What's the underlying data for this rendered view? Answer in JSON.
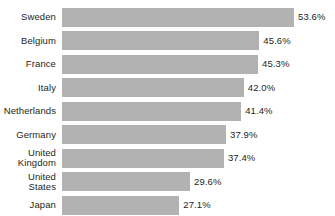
{
  "chart_data": {
    "type": "bar",
    "orientation": "horizontal",
    "title": "",
    "subtitle": "",
    "xlabel": "",
    "ylabel": "",
    "xlim": [
      0,
      60
    ],
    "grid": false,
    "legend": null,
    "value_suffix": "%",
    "bar_color": "#b2b2b2",
    "background_color": "#ffffff",
    "text_color": "#231f20",
    "categories": [
      "Sweden",
      "Belgium",
      "France",
      "Italy",
      "Netherlands",
      "Germany",
      "United\nKingdom",
      "United\nStates",
      "Japan"
    ],
    "values": [
      53.6,
      45.6,
      45.3,
      42.0,
      41.4,
      37.9,
      37.4,
      29.6,
      27.1
    ],
    "value_labels": [
      "53.6%",
      "45.6%",
      "45.3%",
      "42.0%",
      "41.4%",
      "37.9%",
      "37.4%",
      "29.6%",
      "27.1%"
    ]
  },
  "rows": [
    {
      "label": "Sweden",
      "value_label": "53.6%",
      "value": 53.6
    },
    {
      "label": "Belgium",
      "value_label": "45.6%",
      "value": 45.6
    },
    {
      "label": "France",
      "value_label": "45.3%",
      "value": 45.3
    },
    {
      "label": "Italy",
      "value_label": "42.0%",
      "value": 42.0
    },
    {
      "label": "Netherlands",
      "value_label": "41.4%",
      "value": 41.4
    },
    {
      "label": "Germany",
      "value_label": "37.9%",
      "value": 37.9
    },
    {
      "label": "United\nKingdom",
      "value_label": "37.4%",
      "value": 37.4
    },
    {
      "label": "United\nStates",
      "value_label": "29.6%",
      "value": 29.6
    },
    {
      "label": "Japan",
      "value_label": "27.1%",
      "value": 27.1
    }
  ]
}
